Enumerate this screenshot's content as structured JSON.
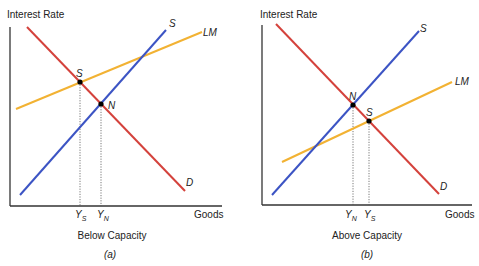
{
  "colors": {
    "demand": "#d4423c",
    "supply": "#3c54c4",
    "lm": "#f2b233",
    "axis": "#333333",
    "text": "#222222"
  },
  "panels": [
    {
      "id": "a",
      "y_axis_label": "Interest Rate",
      "x_axis_label": "Goods",
      "caption": "Below Capacity",
      "panel_label": "(a)",
      "curves": {
        "supply": "S",
        "lm": "LM",
        "demand": "D"
      },
      "points": {
        "first": "S",
        "second": "N"
      },
      "ticks": {
        "first_main": "Y",
        "first_sub": "S",
        "second_main": "Y",
        "second_sub": "N"
      }
    },
    {
      "id": "b",
      "y_axis_label": "Interest Rate",
      "x_axis_label": "Goods",
      "caption": "Above Capacity",
      "panel_label": "(b)",
      "curves": {
        "supply": "S",
        "lm": "LM",
        "demand": "D"
      },
      "points": {
        "first": "N",
        "second": "S"
      },
      "ticks": {
        "first_main": "Y",
        "first_sub": "N",
        "second_main": "Y",
        "second_sub": "S"
      }
    }
  ]
}
